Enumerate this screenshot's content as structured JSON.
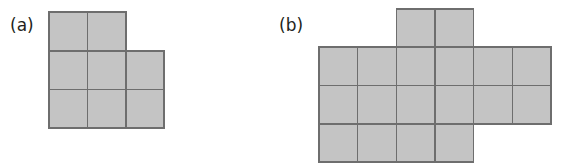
{
  "figure": {
    "background_color": "#ffffff",
    "cell_fill_color": "#c4c4c4",
    "cell_stroke_color": "#6e6e6e",
    "label_color": "#231f20",
    "panels": [
      {
        "id": "panel-a",
        "label": "(a)",
        "label_x": 10,
        "label_y": 31,
        "origin_x": 49,
        "origin_y": 12,
        "cell_width": 38.4,
        "cell_height": 38.7,
        "columns": 3,
        "rows": 3,
        "cell_count": 8,
        "cells": [
          {
            "col": 0,
            "row": 0
          },
          {
            "col": 1,
            "row": 0
          },
          {
            "col": 0,
            "row": 1
          },
          {
            "col": 1,
            "row": 1
          },
          {
            "col": 2,
            "row": 1
          },
          {
            "col": 0,
            "row": 2
          },
          {
            "col": 1,
            "row": 2
          },
          {
            "col": 2,
            "row": 2
          }
        ]
      },
      {
        "id": "panel-b",
        "label": "(b)",
        "label_x": 279,
        "label_y": 31,
        "origin_x": 319,
        "origin_y": 9,
        "cell_width": 38.67,
        "cell_height": 38.25,
        "columns": 6,
        "rows": 4,
        "cell_count": 16,
        "cells": [
          {
            "col": 2,
            "row": 0
          },
          {
            "col": 3,
            "row": 0
          },
          {
            "col": 0,
            "row": 1
          },
          {
            "col": 1,
            "row": 1
          },
          {
            "col": 2,
            "row": 1
          },
          {
            "col": 3,
            "row": 1
          },
          {
            "col": 4,
            "row": 1
          },
          {
            "col": 5,
            "row": 1
          },
          {
            "col": 0,
            "row": 2
          },
          {
            "col": 1,
            "row": 2
          },
          {
            "col": 2,
            "row": 2
          },
          {
            "col": 3,
            "row": 2
          },
          {
            "col": 4,
            "row": 2
          },
          {
            "col": 5,
            "row": 2
          },
          {
            "col": 0,
            "row": 3
          },
          {
            "col": 1,
            "row": 3
          },
          {
            "col": 2,
            "row": 3
          },
          {
            "col": 3,
            "row": 3
          }
        ]
      }
    ]
  }
}
